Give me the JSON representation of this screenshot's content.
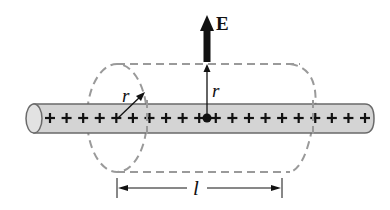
{
  "diagram": {
    "labels": {
      "field": "E",
      "radius_left": "r",
      "radius_center": "r",
      "length": "l"
    },
    "charge_symbol": "+",
    "charge_count": 20,
    "colors": {
      "rod_fill": "#d4d4d4",
      "rod_stroke": "#6a6a6a",
      "dashed_surface": "#9a9a9a",
      "arrow": "#111111",
      "text": "#111111",
      "background": "#ffffff"
    }
  }
}
